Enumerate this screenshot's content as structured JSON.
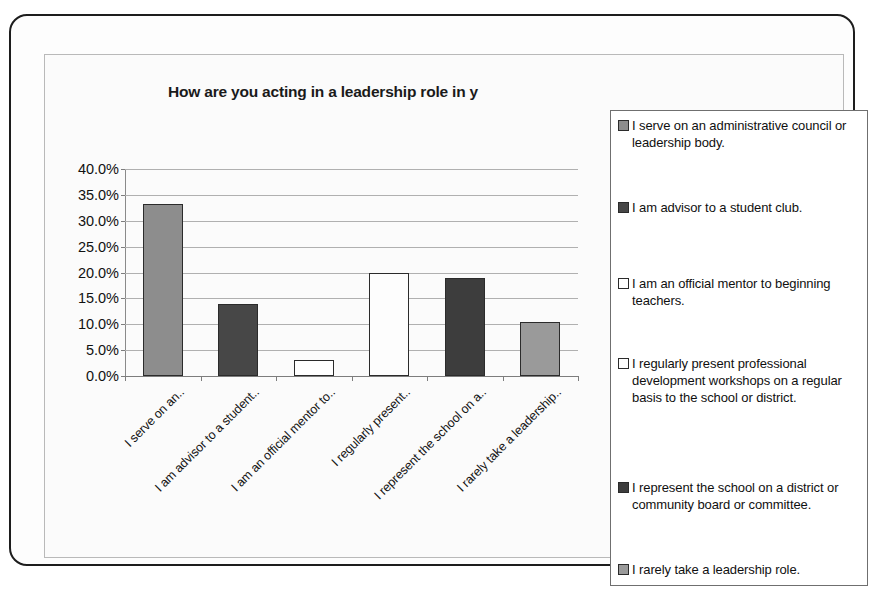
{
  "chart_data": {
    "type": "bar",
    "title": "How are you acting in a leadership role in y",
    "title_truncated": true,
    "xlabel": "",
    "ylabel": "",
    "ylim": [
      0,
      40
    ],
    "ytick_labels": [
      "40.0%",
      "35.0%",
      "30.0%",
      "25.0%",
      "20.0%",
      "15.0%",
      "10.0%",
      "5.0%",
      "0.0%"
    ],
    "ytick_values": [
      40,
      35,
      30,
      25,
      20,
      15,
      10,
      5,
      0
    ],
    "grid": true,
    "legend_position": "right",
    "categories": [
      "I serve on an..",
      "I am advisor to a student..",
      "I am an official mentor to..",
      "I regularly present..",
      "I represent the school on a..",
      "I rarely take a leadership.."
    ],
    "values": [
      33.3,
      14.0,
      3.0,
      20.0,
      19.0,
      10.5
    ],
    "bar_colors": [
      "#8d8d8d",
      "#474747",
      "#ffffff",
      "#fdfdfd",
      "#3d3d3d",
      "#9a9a9a"
    ],
    "bar_edge_color": "#2b2b2b",
    "legend": [
      {
        "label": "I serve on an administrative council or leadership body.",
        "color": "#8d8d8d"
      },
      {
        "label": "I am advisor to a student club.",
        "color": "#474747"
      },
      {
        "label": "I am an official mentor to beginning teachers.",
        "color": "#ffffff"
      },
      {
        "label": "I regularly present professional development workshops on a regular basis to the school or district.",
        "color": "#fdfdfd"
      },
      {
        "label": "I represent the school on a district or community board or committee.",
        "color": "#3d3d3d"
      },
      {
        "label": "I rarely take a leadership role.",
        "color": "#9a9a9a"
      }
    ]
  },
  "colors": {
    "frame": "#1d1d1d",
    "chart_border": "#b9b9b9",
    "gridline": "#b0b0b0",
    "axis": "#7d7d7d",
    "legend_border": "#6f6f6f",
    "text": "#101010",
    "background": "#fbfbfb"
  }
}
